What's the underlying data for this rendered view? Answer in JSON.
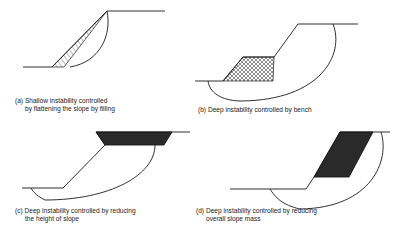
{
  "panels": [
    {
      "id": "a",
      "caption_line1": "(a) Shallow instability controlled",
      "caption_line2": "by flattening the slope by filling",
      "remedy_fill": "hatched fill on slope face"
    },
    {
      "id": "b",
      "caption_line1": "(b) Deep instability controlled by bench",
      "caption_line2": "",
      "remedy_fill": "cross-hatched bench at toe"
    },
    {
      "id": "c",
      "caption_line1": "(c) Deep instability controlled by reducing",
      "caption_line2": "the height of slope",
      "remedy_fill": "dark removed crest block"
    },
    {
      "id": "d",
      "caption_line1": "(d) Deep instability controlled by reducing",
      "caption_line2": "overall slope mass",
      "remedy_fill": "dark removed slope block"
    }
  ],
  "colors": {
    "line": "#1a1a1a",
    "fill_dark": "#2a2a2a",
    "background": "#ffffff"
  }
}
